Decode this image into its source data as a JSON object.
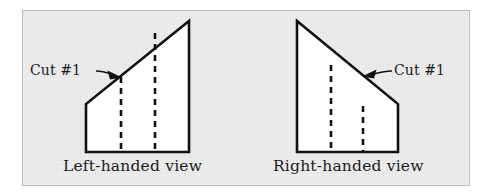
{
  "figure": {
    "background_color": "#ececec",
    "border_color": "#b9b9b9",
    "ink_color": "#111111",
    "fill_color": "#ffffff",
    "panels": [
      {
        "id": "left-handed",
        "caption": "Left-handed view",
        "annotation": "Cut #1",
        "orientation": "left",
        "outline_points": "86,104 86,152 189,152 189,21",
        "dashed_lines": [
          {
            "x": 121,
            "y_top": 77,
            "y_bottom": 152
          },
          {
            "x": 155,
            "y_top": 33,
            "y_bottom": 152
          }
        ],
        "cut_point": {
          "x": 121,
          "y": 77
        },
        "leader_line": "96,72 116,75",
        "arrow_head": "122,77 108,71 110,79",
        "label_position": {
          "x": 30,
          "y": 62
        },
        "caption_position": {
          "x": 63,
          "y": 157
        }
      },
      {
        "id": "right-handed",
        "caption": "Right-handed view",
        "annotation": "Cut #1",
        "orientation": "right",
        "outline_points": "297,21 297,152 398,152 398,104",
        "dashed_lines": [
          {
            "x": 331,
            "y_top": 65,
            "y_bottom": 152
          },
          {
            "x": 363,
            "y_top": 106,
            "y_bottom": 152
          }
        ],
        "cut_point": {
          "x": 363,
          "y": 76
        },
        "leader_line": "390,72 369,74",
        "arrow_head": "362,76 376,70 374,79",
        "label_position": {
          "x": 394,
          "y": 62
        },
        "caption_position": {
          "x": 275,
          "y": 157
        }
      }
    ]
  }
}
